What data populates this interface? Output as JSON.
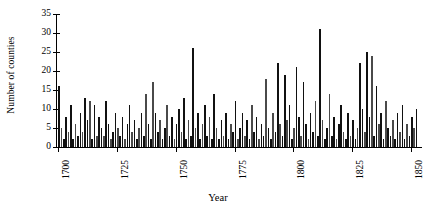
{
  "chart_data": {
    "type": "bar",
    "title": "",
    "xlabel": "Year",
    "ylabel": "Number of counties",
    "xlim": [
      1699,
      1853
    ],
    "ylim": [
      0,
      35
    ],
    "ytick_values": [
      0,
      5,
      10,
      15,
      20,
      25,
      30,
      35
    ],
    "ytick_labels": [
      "0",
      "5",
      "10",
      "15",
      "20",
      "25",
      "30",
      "35"
    ],
    "xtick_values": [
      1700,
      1725,
      1750,
      1775,
      1800,
      1825,
      1850
    ],
    "xtick_labels": [
      "1700",
      "1725",
      "1750",
      "1775",
      "1800",
      "1825",
      "1850"
    ],
    "grid": false,
    "legend": false,
    "bar_color": "#111111",
    "axis_color": "#000000",
    "categories": [
      1700,
      1701,
      1702,
      1703,
      1704,
      1705,
      1706,
      1707,
      1708,
      1709,
      1710,
      1711,
      1712,
      1713,
      1714,
      1715,
      1716,
      1717,
      1718,
      1719,
      1720,
      1721,
      1722,
      1723,
      1724,
      1725,
      1726,
      1727,
      1728,
      1729,
      1730,
      1731,
      1732,
      1733,
      1734,
      1735,
      1736,
      1737,
      1738,
      1739,
      1740,
      1741,
      1742,
      1743,
      1744,
      1745,
      1746,
      1747,
      1748,
      1749,
      1750,
      1751,
      1752,
      1753,
      1754,
      1755,
      1756,
      1757,
      1758,
      1759,
      1760,
      1761,
      1762,
      1763,
      1764,
      1765,
      1766,
      1767,
      1768,
      1769,
      1770,
      1771,
      1772,
      1773,
      1774,
      1775,
      1776,
      1777,
      1778,
      1779,
      1780,
      1781,
      1782,
      1783,
      1784,
      1785,
      1786,
      1787,
      1788,
      1789,
      1790,
      1791,
      1792,
      1793,
      1794,
      1795,
      1796,
      1797,
      1798,
      1799,
      1800,
      1801,
      1802,
      1803,
      1804,
      1805,
      1806,
      1807,
      1808,
      1809,
      1810,
      1811,
      1812,
      1813,
      1814,
      1815,
      1816,
      1817,
      1818,
      1819,
      1820,
      1821,
      1822,
      1823,
      1824,
      1825,
      1826,
      1827,
      1828,
      1829,
      1830,
      1831,
      1832,
      1833,
      1834,
      1835,
      1836,
      1837,
      1838,
      1839,
      1840,
      1841,
      1842,
      1843,
      1844,
      1845,
      1846,
      1847,
      1848,
      1849,
      1850,
      1851,
      1852
    ],
    "values": [
      16,
      5,
      2,
      8,
      4,
      11,
      2,
      6,
      3,
      9,
      4,
      13,
      7,
      12,
      2,
      11,
      3,
      8,
      5,
      3,
      12,
      6,
      2,
      4,
      9,
      5,
      3,
      8,
      2,
      6,
      11,
      4,
      7,
      2,
      5,
      9,
      3,
      14,
      6,
      2,
      17,
      9,
      4,
      7,
      2,
      5,
      11,
      3,
      8,
      2,
      6,
      10,
      4,
      13,
      2,
      7,
      3,
      26,
      5,
      9,
      2,
      6,
      11,
      3,
      8,
      2,
      14,
      5,
      2,
      7,
      3,
      9,
      2,
      6,
      4,
      12,
      2,
      5,
      9,
      3,
      7,
      2,
      11,
      4,
      8,
      2,
      6,
      3,
      18,
      5,
      2,
      9,
      4,
      22,
      6,
      3,
      19,
      7,
      11,
      2,
      5,
      21,
      8,
      3,
      17,
      6,
      2,
      9,
      4,
      12,
      3,
      31,
      7,
      2,
      5,
      14,
      3,
      8,
      2,
      6,
      11,
      4,
      2,
      9,
      3,
      7,
      2,
      5,
      22,
      10,
      4,
      25,
      8,
      24,
      3,
      16,
      6,
      9,
      2,
      12,
      5,
      3,
      7,
      2,
      9,
      4,
      11,
      2,
      6,
      3,
      8,
      5,
      10
    ]
  },
  "figure": {
    "background": "#ffffff"
  }
}
